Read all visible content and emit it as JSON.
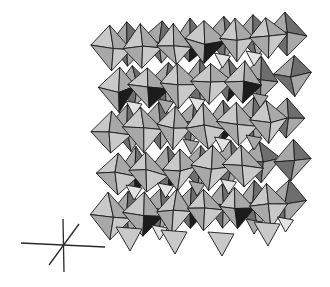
{
  "figure": {
    "type": "polyhedral crystal structure model",
    "bounds": {
      "x": 97,
      "y": 26,
      "width": 215,
      "height": 230
    },
    "grid": {
      "cols": 6,
      "rows": 5,
      "cell_w": 34,
      "cell_h": 42
    },
    "shades": {
      "light": "#c9c9c9",
      "mid": "#a8a8a8",
      "dark": "#6e6e6e",
      "black": "#1c1c1c",
      "highlight": "#e2e2e2"
    },
    "background": "#ffffff"
  },
  "axes_indicator": {
    "center": {
      "x": 64,
      "y": 244
    },
    "lines": [
      {
        "name": "horizontal-axis",
        "x1": 21,
        "y1": 243,
        "x2": 105,
        "y2": 247
      },
      {
        "name": "vertical-axis",
        "x1": 63,
        "y1": 219,
        "x2": 64,
        "y2": 272
      },
      {
        "name": "diagonal-axis",
        "x1": 49,
        "y1": 265,
        "x2": 79,
        "y2": 224
      }
    ]
  }
}
